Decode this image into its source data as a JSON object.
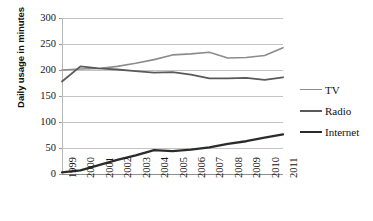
{
  "chart_data": {
    "type": "line",
    "title": "",
    "xlabel": "",
    "ylabel": "Daily usage in minutes",
    "categories": [
      "1999",
      "2000",
      "2001",
      "2002",
      "2003",
      "2004",
      "2005",
      "2006",
      "2007",
      "2008",
      "2009",
      "2010",
      "2011"
    ],
    "ylim": [
      0,
      300
    ],
    "yticks": [
      0,
      50,
      100,
      150,
      200,
      250,
      300
    ],
    "ytick_labels": [
      "0",
      "50",
      "100",
      "150",
      "200",
      "250",
      "300"
    ],
    "grid": true,
    "legend_position": "right",
    "series": [
      {
        "name": "TV",
        "color": "#8c8c8c",
        "values": [
          200,
          202,
          203,
          207,
          213,
          220,
          229,
          231,
          234,
          223,
          224,
          228,
          243
        ]
      },
      {
        "name": "Radio",
        "color": "#5a5a5a",
        "values": [
          178,
          207,
          203,
          201,
          198,
          195,
          196,
          191,
          184,
          184,
          185,
          181,
          186
        ]
      },
      {
        "name": "Internet",
        "color": "#2b2b2b",
        "values": [
          3,
          7,
          17,
          27,
          36,
          46,
          44,
          47,
          51,
          58,
          63,
          70,
          76
        ]
      }
    ]
  },
  "legend": {
    "items": [
      {
        "label": "TV"
      },
      {
        "label": "Radio"
      },
      {
        "label": "Internet"
      }
    ]
  },
  "colors": {
    "tv": "#8c8c8c",
    "radio": "#5a5a5a",
    "internet": "#2b2b2b",
    "gridline": "#c4c4c4",
    "axis": "#8f8f8f",
    "background": "#ffffff"
  }
}
